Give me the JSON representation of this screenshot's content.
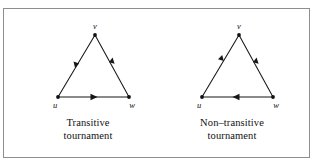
{
  "figure": {
    "background_color": "#ffffff",
    "frame_color": "#8e8e8e",
    "ink_color": "#171717",
    "panels": [
      {
        "id": "transitive",
        "caption_line1": "Transitive",
        "caption_line2": "tournament",
        "vertices": [
          {
            "name": "v",
            "label": "v",
            "x": 77,
            "y": 12
          },
          {
            "name": "u",
            "label": "u",
            "x": 40,
            "y": 74
          },
          {
            "name": "w",
            "label": "w",
            "x": 111,
            "y": 74
          }
        ],
        "edges": [
          {
            "name": "edge-v-u",
            "from": "v",
            "to": "u",
            "label": "v to u"
          },
          {
            "name": "edge-v-w",
            "from": "v",
            "to": "w",
            "label": "v to w"
          },
          {
            "name": "edge-u-w",
            "from": "u",
            "to": "w",
            "label": "u to w"
          }
        ]
      },
      {
        "id": "nontransitive",
        "caption_line1": "Non–transitive",
        "caption_line2": "tournament",
        "vertices": [
          {
            "name": "v",
            "label": "v",
            "x": 77,
            "y": 12
          },
          {
            "name": "u",
            "label": "u",
            "x": 40,
            "y": 74
          },
          {
            "name": "w",
            "label": "w",
            "x": 111,
            "y": 74
          }
        ],
        "edges": [
          {
            "name": "edge-u-v",
            "from": "u",
            "to": "v",
            "label": "u to v"
          },
          {
            "name": "edge-v-w",
            "from": "v",
            "to": "w",
            "label": "v to w"
          },
          {
            "name": "edge-w-u",
            "from": "w",
            "to": "u",
            "label": "w to u"
          }
        ]
      }
    ]
  }
}
